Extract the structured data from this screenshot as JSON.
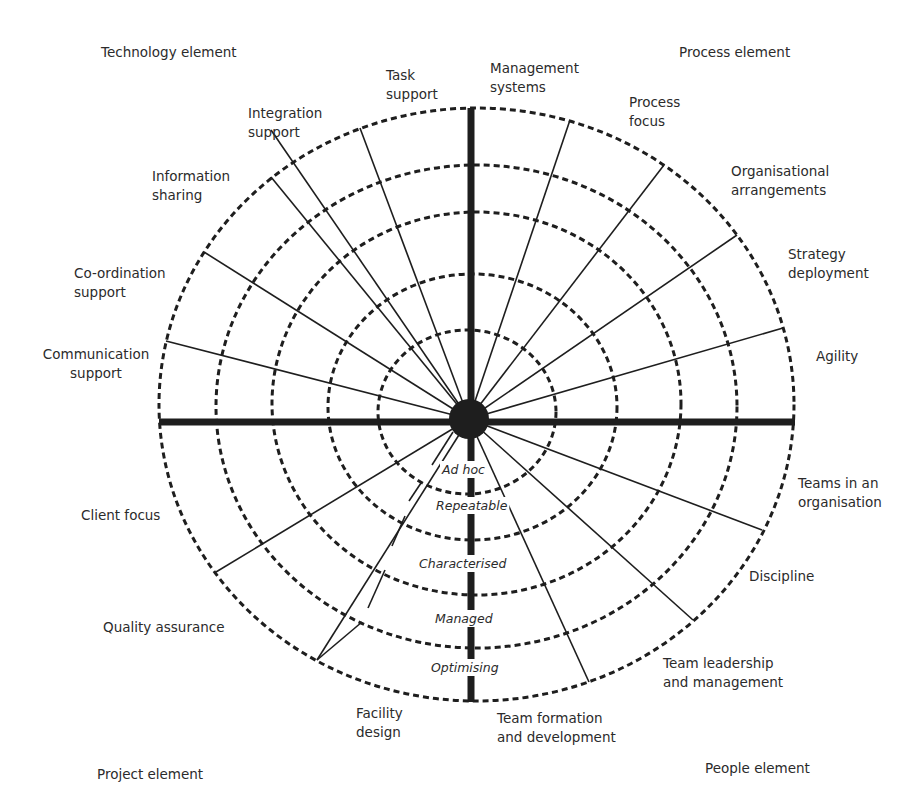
{
  "diagram": {
    "colors": {
      "line": "#1e1e1e",
      "text": "#2b2b2b",
      "background": "#ffffff"
    },
    "hub": {
      "cx": 469,
      "cy": 419,
      "r": 20
    },
    "axes": {
      "horizontal": {
        "x1": 159,
        "x2": 795,
        "y": 422,
        "width": 7
      },
      "vertical": {
        "x": 471,
        "y1": 108,
        "y2": 702,
        "width": 7
      }
    },
    "rings": [
      {
        "level": 1,
        "left": 378,
        "right": 556,
        "top": 330,
        "bottom": 494
      },
      {
        "level": 2,
        "left": 328,
        "right": 617,
        "top": 274,
        "bottom": 540
      },
      {
        "level": 3,
        "left": 272,
        "right": 681,
        "top": 212,
        "bottom": 595
      },
      {
        "level": 4,
        "left": 216,
        "right": 737,
        "top": 165,
        "bottom": 648
      },
      {
        "level": 5,
        "left": 159,
        "right": 794,
        "top": 108,
        "bottom": 701
      }
    ],
    "maturity_levels": [
      {
        "label": "Ad hoc",
        "x": 442,
        "y": 474
      },
      {
        "label": "Repeatable",
        "x": 436,
        "y": 510
      },
      {
        "label": "Characterised",
        "x": 419,
        "y": 568
      },
      {
        "label": "Managed",
        "x": 435,
        "y": 623
      },
      {
        "label": "Optimising",
        "x": 431,
        "y": 672
      }
    ],
    "corner_labels": [
      {
        "label": "Technology element",
        "x": 101,
        "y": 57,
        "anchor": "start"
      },
      {
        "label": "Process element",
        "x": 679,
        "y": 57,
        "anchor": "start"
      },
      {
        "label": "Project element",
        "x": 97,
        "y": 779,
        "anchor": "start"
      },
      {
        "label": "People element",
        "x": 705,
        "y": 773,
        "anchor": "start"
      }
    ],
    "quadrants": [
      {
        "name": "Technology element",
        "spokes": [
          {
            "lines": [
              "Task",
              "support"
            ],
            "end": [
              360,
              128
            ],
            "text_x": 386,
            "text_y": 80,
            "anchor": "start"
          },
          {
            "lines": [
              "Integration",
              "support"
            ],
            "end": [
              271,
              130
            ],
            "text_x": 248,
            "text_y": 118,
            "anchor": "start"
          },
          {
            "lines": [
              "Information",
              "sharing"
            ],
            "end": [
              271,
              177
            ],
            "text_x": 152,
            "text_y": 181,
            "anchor": "start"
          },
          {
            "lines": [
              "Co-ordination",
              "support"
            ],
            "end": [
              204,
              252
            ],
            "text_x": 74,
            "text_y": 278,
            "anchor": "start"
          },
          {
            "lines": [
              "Communication",
              "support"
            ],
            "end": [
              166,
              341
            ],
            "text_x": 96,
            "text_y": 359,
            "anchor": "middle"
          }
        ]
      },
      {
        "name": "Process element",
        "spokes": [
          {
            "lines": [
              "Management",
              "systems"
            ],
            "end": null,
            "text_x": 490,
            "text_y": 73,
            "anchor": "start"
          },
          {
            "lines": [
              "Process",
              "focus"
            ],
            "end": [
              570,
              120
            ],
            "text_x": 629,
            "text_y": 107,
            "anchor": "start"
          },
          {
            "lines": [
              "Organisational",
              "arrangements"
            ],
            "end": [
              664,
              165
            ],
            "text_x": 731,
            "text_y": 176,
            "anchor": "start"
          },
          {
            "lines": [
              "Strategy",
              "deployment"
            ],
            "end": [
              737,
              235
            ],
            "text_x": 788,
            "text_y": 259,
            "anchor": "start"
          },
          {
            "lines": [
              "Agility"
            ],
            "end": [
              783,
              328
            ],
            "text_x": 816,
            "text_y": 361,
            "anchor": "start"
          }
        ]
      },
      {
        "name": "People element",
        "spokes": [
          {
            "lines": [
              "Teams in an",
              "organisation"
            ],
            "end": [
              762,
              530
            ],
            "text_x": 798,
            "text_y": 488,
            "anchor": "start"
          },
          {
            "lines": [
              "Discipline"
            ],
            "end": [
              693,
              620
            ],
            "text_x": 749,
            "text_y": 581,
            "anchor": "start"
          },
          {
            "lines": [
              "Team leadership",
              "and management"
            ],
            "end": [
              589,
              682
            ],
            "text_x": 663,
            "text_y": 668,
            "anchor": "start"
          },
          {
            "lines": [
              "Team formation",
              "and development"
            ],
            "end": null,
            "text_x": 497,
            "text_y": 723,
            "anchor": "start"
          }
        ]
      },
      {
        "name": "Project element",
        "spokes": [
          {
            "lines": [
              "Client focus"
            ],
            "end": [
              216,
              572
            ],
            "text_x": 81,
            "text_y": 520,
            "anchor": "start"
          },
          {
            "lines": [
              "Quality assurance"
            ],
            "end": [
              317,
              660
            ],
            "text_x": 103,
            "text_y": 632,
            "anchor": "start"
          },
          {
            "lines": [
              "Facility",
              "design"
            ],
            "end": null,
            "text_x": 356,
            "text_y": 718,
            "anchor": "start"
          }
        ]
      }
    ],
    "level_leader": {
      "segments": [
        [
          [
            453,
            432
          ],
          [
            432,
            465
          ]
        ],
        [
          [
            421,
            483
          ],
          [
            409,
            501
          ]
        ],
        [
          [
            405,
            516
          ],
          [
            392,
            546
          ]
        ],
        [
          [
            385,
            570
          ],
          [
            368,
            608
          ]
        ],
        [
          [
            362,
            622
          ],
          [
            317,
            660
          ]
        ]
      ]
    }
  }
}
